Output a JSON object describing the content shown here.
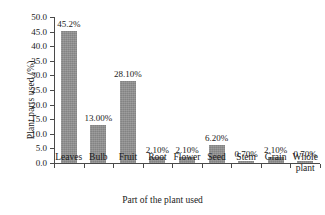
{
  "chart_data": {
    "type": "bar",
    "title": "",
    "xlabel": "Part of the plant used",
    "ylabel": "Plant parts used (%)",
    "categories": [
      "Leaves",
      "Bulb",
      "Fruit",
      "Root",
      "Flower",
      "Seed",
      "Stem",
      "Grain",
      "Whole plant"
    ],
    "values": [
      45.2,
      13.0,
      28.1,
      2.1,
      2.1,
      6.2,
      0.7,
      2.1,
      0.7
    ],
    "data_labels": [
      "45.2%",
      "13.00%",
      "28.10%",
      "2.10%",
      "2.10%",
      "6.20%",
      "0.70%",
      "2.10%",
      "0.70%"
    ],
    "ylim": [
      0.0,
      50.0
    ],
    "ytick_values": [
      0.0,
      5.0,
      10.0,
      15.0,
      20.0,
      25.0,
      30.0,
      35.0,
      40.0,
      45.0,
      50.0
    ],
    "ytick_labels": [
      "0.0",
      "5.0",
      "10.0",
      "15.0",
      "20.0",
      "25.0",
      "30.0",
      "35.0",
      "40.0",
      "45.0",
      "50.0"
    ],
    "grid": false,
    "legend": false,
    "bar_color": "#909090",
    "axis_color": "#4a4a4a",
    "text_color": "#1a1a1a"
  }
}
